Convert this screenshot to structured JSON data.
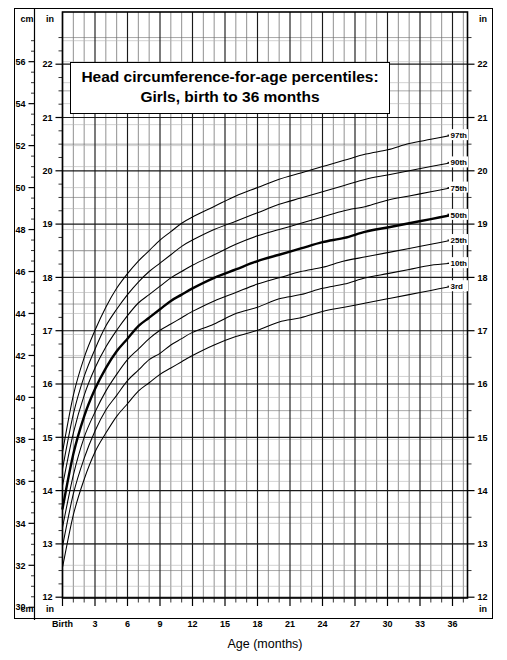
{
  "title": {
    "line1": "Head circumference-for-age percentiles:",
    "line2": "Girls, birth to 36 months"
  },
  "axes": {
    "left_unit_top": "cm",
    "left_unit_inner_top": "in",
    "left_unit_bottom": "cm",
    "left_unit_inner_bottom": "in",
    "right_unit_top": "in",
    "right_unit_bottom": "in",
    "x_title": "Age (months)",
    "x_first_label": "Birth"
  },
  "chart_data": {
    "type": "line",
    "title": "Head circumference-for-age percentiles: Girls, birth to 36 months",
    "xlabel": "Age (months)",
    "ylabel": "Head circumference",
    "y_unit_primary": "in",
    "y_unit_secondary": "cm",
    "xlim": [
      0,
      38
    ],
    "ylim_in": [
      12,
      22.6
    ],
    "ylim_cm": [
      30,
      57.4
    ],
    "grid": true,
    "legend": "right-edge-curve-labels",
    "x_ticks": [
      0,
      3,
      6,
      9,
      12,
      15,
      18,
      21,
      24,
      27,
      30,
      33,
      36
    ],
    "x_tick_labels": [
      "Birth",
      "3",
      "6",
      "9",
      "12",
      "15",
      "18",
      "21",
      "24",
      "27",
      "30",
      "33",
      "36"
    ],
    "y_ticks_in": [
      12,
      13,
      14,
      15,
      16,
      17,
      18,
      19,
      20,
      21,
      22
    ],
    "y_tick_labels_in": [
      "12",
      "13",
      "14",
      "15",
      "16",
      "17",
      "18",
      "19",
      "20",
      "21",
      "22"
    ],
    "y_ticks_cm": [
      30,
      32,
      34,
      36,
      38,
      40,
      42,
      44,
      46,
      48,
      50,
      52,
      54,
      56
    ],
    "y_tick_labels_cm": [
      "30",
      "32",
      "34",
      "36",
      "38",
      "40",
      "42",
      "44",
      "46",
      "48",
      "50",
      "52",
      "54",
      "56"
    ],
    "x": [
      0,
      1,
      2,
      3,
      4,
      5,
      6,
      7,
      8,
      9,
      10,
      11,
      12,
      14,
      16,
      18,
      20,
      22,
      24,
      26,
      28,
      30,
      32,
      34,
      36
    ],
    "series": [
      {
        "name": "97th",
        "label": "97th",
        "bold": false,
        "values_cm": [
          37.4,
          40.1,
          41.9,
          43.2,
          44.3,
          45.2,
          45.9,
          46.5,
          47.0,
          47.5,
          47.9,
          48.3,
          48.6,
          49.1,
          49.6,
          50.0,
          50.4,
          50.7,
          51.0,
          51.3,
          51.6,
          51.8,
          52.1,
          52.3,
          52.5
        ]
      },
      {
        "name": "90th",
        "label": "90th",
        "bold": false,
        "values_cm": [
          36.6,
          39.2,
          41.0,
          42.3,
          43.4,
          44.2,
          44.9,
          45.5,
          46.0,
          46.4,
          46.8,
          47.2,
          47.5,
          48.0,
          48.4,
          48.8,
          49.2,
          49.5,
          49.8,
          50.1,
          50.4,
          50.6,
          50.8,
          51.0,
          51.2
        ]
      },
      {
        "name": "75th",
        "label": "75th",
        "bold": false,
        "values_cm": [
          35.8,
          38.3,
          40.1,
          41.4,
          42.4,
          43.2,
          43.9,
          44.5,
          44.9,
          45.3,
          45.7,
          46.0,
          46.3,
          46.8,
          47.3,
          47.7,
          48.0,
          48.3,
          48.6,
          48.9,
          49.1,
          49.4,
          49.6,
          49.8,
          50.0
        ]
      },
      {
        "name": "50th",
        "label": "50th",
        "bold": true,
        "values_cm": [
          34.7,
          37.3,
          39.1,
          40.4,
          41.4,
          42.2,
          42.8,
          43.4,
          43.8,
          44.2,
          44.6,
          44.9,
          45.2,
          45.7,
          46.1,
          46.5,
          46.8,
          47.1,
          47.4,
          47.6,
          47.9,
          48.1,
          48.3,
          48.5,
          48.7
        ]
      },
      {
        "name": "25th",
        "label": "25th",
        "bold": false,
        "values_cm": [
          33.8,
          36.3,
          38.1,
          39.3,
          40.3,
          41.1,
          41.8,
          42.3,
          42.8,
          43.2,
          43.5,
          43.8,
          44.1,
          44.6,
          45.0,
          45.4,
          45.7,
          46.0,
          46.2,
          46.5,
          46.7,
          46.9,
          47.1,
          47.3,
          47.5
        ]
      },
      {
        "name": "10th",
        "label": "10th",
        "bold": false,
        "values_cm": [
          32.9,
          35.4,
          37.1,
          38.4,
          39.4,
          40.1,
          40.8,
          41.3,
          41.8,
          42.1,
          42.5,
          42.8,
          43.1,
          43.5,
          44.0,
          44.3,
          44.7,
          44.9,
          45.2,
          45.4,
          45.7,
          45.9,
          46.1,
          46.3,
          46.4
        ]
      },
      {
        "name": "3rd",
        "label": "3rd",
        "bold": false,
        "values_cm": [
          31.9,
          34.4,
          36.1,
          37.4,
          38.3,
          39.1,
          39.7,
          40.3,
          40.7,
          41.1,
          41.4,
          41.7,
          42.0,
          42.5,
          42.9,
          43.2,
          43.6,
          43.8,
          44.1,
          44.3,
          44.5,
          44.7,
          44.9,
          45.1,
          45.3
        ]
      }
    ]
  },
  "colors": {
    "curve": "#000000",
    "grid_major": "#1a1a1a",
    "grid_minor": "#8c8c8c",
    "frame": "#000000",
    "background": "#ffffff"
  }
}
